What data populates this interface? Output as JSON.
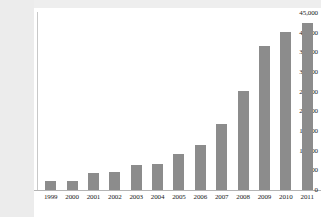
{
  "chart_data": {
    "type": "bar",
    "title": "",
    "xlabel": "",
    "ylabel": "",
    "categories": [
      "1999",
      "2000",
      "2001",
      "2002",
      "2003",
      "2004",
      "2005",
      "2006",
      "2007",
      "2008",
      "2009",
      "2010",
      "2011"
    ],
    "values": [
      2300,
      2400,
      4200,
      4600,
      6400,
      6700,
      9100,
      11500,
      16800,
      25300,
      36600,
      40200,
      42400
    ],
    "ylim": [
      0,
      45000
    ],
    "ytick_labels": [
      "45,000",
      "40,000",
      "35,000",
      "30,000",
      "25,000",
      "20,000",
      "15,000",
      "10,000",
      "5,000",
      "0"
    ],
    "ytick_values": [
      45000,
      40000,
      35000,
      30000,
      25000,
      20000,
      15000,
      10000,
      5000,
      0
    ],
    "grid": false,
    "legend": null,
    "bar_color": "#8c8c8c",
    "plot_background": "#ffffff",
    "label_band_color": "#ececec",
    "axis_color": "#b4b4b4"
  }
}
